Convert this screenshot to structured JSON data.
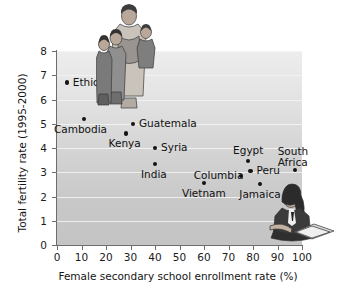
{
  "chart_data": {
    "type": "scatter",
    "title": "",
    "xlabel": "Female secondary school enrollment rate (%)",
    "ylabel": "Total fertility rate (1995-2000)",
    "xlim": [
      0,
      100
    ],
    "ylim": [
      0,
      8
    ],
    "xticks": [
      0,
      10,
      20,
      30,
      40,
      50,
      60,
      70,
      80,
      90,
      100
    ],
    "yticks": [
      0,
      1,
      2,
      3,
      4,
      5,
      6,
      7,
      8
    ],
    "grid": "horizontal",
    "legend": "none",
    "points": [
      {
        "name": "Ethiopia",
        "x": 4,
        "y": 6.7,
        "label_dx": 6,
        "label_dy": -6
      },
      {
        "name": "Cambodia",
        "x": 11,
        "y": 5.2,
        "label_dx": -30,
        "label_dy": 5
      },
      {
        "name": "Guatemala",
        "x": 31,
        "y": 5.0,
        "label_dx": 6,
        "label_dy": -6
      },
      {
        "name": "Kenya",
        "x": 28,
        "y": 4.6,
        "label_dx": -17,
        "label_dy": 5
      },
      {
        "name": "Syria",
        "x": 40,
        "y": 4.0,
        "label_dx": 6,
        "label_dy": -6
      },
      {
        "name": "India",
        "x": 40,
        "y": 3.35,
        "label_dx": -14,
        "label_dy": 5
      },
      {
        "name": "Egypt",
        "x": 78,
        "y": 3.45,
        "label_dx": -15,
        "label_dy": -16
      },
      {
        "name": "South\nAfrica",
        "x": 97,
        "y": 3.1,
        "label_dx": -17,
        "label_dy": -24
      },
      {
        "name": "Peru",
        "x": 79,
        "y": 3.05,
        "label_dx": 6,
        "label_dy": -6
      },
      {
        "name": "Columbia",
        "x": 75,
        "y": 2.85,
        "label_dx": -47,
        "label_dy": -6
      },
      {
        "name": "Vietnam",
        "x": 60,
        "y": 2.55,
        "label_dx": -22,
        "label_dy": 5
      },
      {
        "name": "Jamaica",
        "x": 83,
        "y": 2.5,
        "label_dx": -21,
        "label_dy": 5
      }
    ]
  },
  "illustrations": [
    {
      "id": "family",
      "description": "mother-with-children-illustration"
    },
    {
      "id": "student",
      "description": "seated-student-reading-book-illustration"
    }
  ],
  "colors": {
    "plot_background_top": "#ededed",
    "plot_background_bottom": "#c4c4c4",
    "gridline": "#f4f4f4",
    "axis": "#6d6d6d",
    "point": "#141414",
    "text": "#111111"
  }
}
